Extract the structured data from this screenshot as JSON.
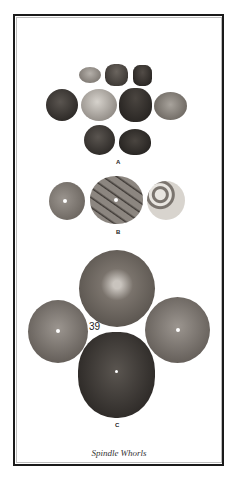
{
  "plate": {
    "caption": "Spindle Whorls",
    "groups": [
      {
        "label": "A"
      },
      {
        "label": "B"
      },
      {
        "label": "C",
        "number": "39"
      }
    ]
  },
  "colors": {
    "frame_outer": "#1a1a1a",
    "frame_inner": "#bdbdbd",
    "dark_whorl": "#3a3632",
    "mid_whorl": "#6a645e",
    "light_whorl": "#a8a39c"
  }
}
